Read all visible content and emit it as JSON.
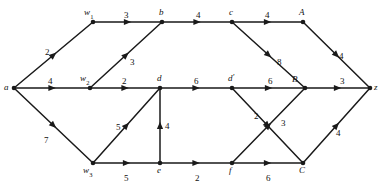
{
  "diagram": {
    "type": "directed-weighted-network-flow-graph",
    "canvas": {
      "width": 388,
      "height": 187,
      "background": "#ffffff"
    },
    "stroke_color": "#1a1a1a",
    "text_color": "#111111",
    "nodes": [
      {
        "id": "a",
        "label": "a",
        "sub": "",
        "prime": false,
        "x": 14,
        "y": 88,
        "label_dx": -10,
        "label_dy": -5
      },
      {
        "id": "w1",
        "label": "w",
        "sub": "1",
        "prime": false,
        "x": 93,
        "y": 22,
        "label_dx": -9,
        "label_dy": -14
      },
      {
        "id": "w2",
        "label": "w",
        "sub": "2",
        "prime": false,
        "x": 90,
        "y": 88,
        "label_dx": -10,
        "label_dy": -14
      },
      {
        "id": "w3",
        "label": "w",
        "sub": "3",
        "prime": false,
        "x": 93,
        "y": 163,
        "label_dx": -10,
        "label_dy": 3
      },
      {
        "id": "b",
        "label": "b",
        "sub": "",
        "prime": false,
        "x": 162,
        "y": 22,
        "label_dx": -3,
        "label_dy": -14
      },
      {
        "id": "d",
        "label": "d",
        "sub": "",
        "prime": false,
        "x": 160,
        "y": 88,
        "label_dx": -3,
        "label_dy": -14
      },
      {
        "id": "e",
        "label": "e",
        "sub": "",
        "prime": false,
        "x": 160,
        "y": 163,
        "label_dx": -3,
        "label_dy": 3
      },
      {
        "id": "c",
        "label": "c",
        "sub": "",
        "prime": false,
        "x": 232,
        "y": 22,
        "label_dx": -3,
        "label_dy": -14
      },
      {
        "id": "dp",
        "label": "d",
        "sub": "",
        "prime": true,
        "x": 232,
        "y": 88,
        "label_dx": -4,
        "label_dy": -14
      },
      {
        "id": "f",
        "label": "f",
        "sub": "",
        "prime": false,
        "x": 232,
        "y": 163,
        "label_dx": -3,
        "label_dy": 3
      },
      {
        "id": "A",
        "label": "A",
        "sub": "",
        "prime": false,
        "x": 303,
        "y": 22,
        "label_dx": -4,
        "label_dy": -14
      },
      {
        "id": "B",
        "label": "B",
        "sub": "",
        "prime": false,
        "x": 305,
        "y": 88,
        "label_dx": -13,
        "label_dy": -13
      },
      {
        "id": "C",
        "label": "C",
        "sub": "",
        "prime": false,
        "x": 303,
        "y": 163,
        "label_dx": -4,
        "label_dy": 3
      },
      {
        "id": "z",
        "label": "z",
        "sub": "",
        "prime": false,
        "x": 370,
        "y": 88,
        "label_dx": 4,
        "label_dy": -5
      }
    ],
    "edges": [
      {
        "from": "a",
        "to": "w1",
        "weight": "2",
        "wx": 45,
        "wy": 48
      },
      {
        "from": "a",
        "to": "w2",
        "weight": "4",
        "wx": 48,
        "wy": 77
      },
      {
        "from": "a",
        "to": "w3",
        "weight": "7",
        "wx": 44,
        "wy": 136
      },
      {
        "from": "w1",
        "to": "b",
        "weight": "3",
        "wx": 124,
        "wy": 11
      },
      {
        "from": "w2",
        "to": "b",
        "weight": "3",
        "wx": 130,
        "wy": 58
      },
      {
        "from": "w2",
        "to": "d",
        "weight": "2",
        "wx": 122,
        "wy": 77
      },
      {
        "from": "w3",
        "to": "d",
        "weight": "5",
        "wx": 116,
        "wy": 123
      },
      {
        "from": "w3",
        "to": "e",
        "weight": "5",
        "wx": 124,
        "wy": 174
      },
      {
        "from": "b",
        "to": "c",
        "weight": "4",
        "wx": 196,
        "wy": 11
      },
      {
        "from": "d",
        "to": "dp",
        "weight": "6",
        "wx": 194,
        "wy": 77
      },
      {
        "from": "e",
        "to": "d",
        "weight": "4",
        "wx": 165,
        "wy": 122
      },
      {
        "from": "e",
        "to": "f",
        "weight": "2",
        "wx": 195,
        "wy": 174
      },
      {
        "from": "c",
        "to": "A",
        "weight": "4",
        "wx": 265,
        "wy": 11
      },
      {
        "from": "c",
        "to": "B",
        "weight": "8",
        "wx": 277,
        "wy": 58
      },
      {
        "from": "dp",
        "to": "C",
        "weight": "2",
        "wx": 254,
        "wy": 112
      },
      {
        "from": "dp",
        "to": "B",
        "weight": "6",
        "wx": 268,
        "wy": 77
      },
      {
        "from": "f",
        "to": "B",
        "weight": "3",
        "wx": 281,
        "wy": 119
      },
      {
        "from": "f",
        "to": "C",
        "weight": "6",
        "wx": 266,
        "wy": 174
      },
      {
        "from": "A",
        "to": "z",
        "weight": "4",
        "wx": 339,
        "wy": 52
      },
      {
        "from": "B",
        "to": "z",
        "weight": "3",
        "wx": 340,
        "wy": 77
      },
      {
        "from": "C",
        "to": "z",
        "weight": "4",
        "wx": 336,
        "wy": 129
      }
    ]
  }
}
